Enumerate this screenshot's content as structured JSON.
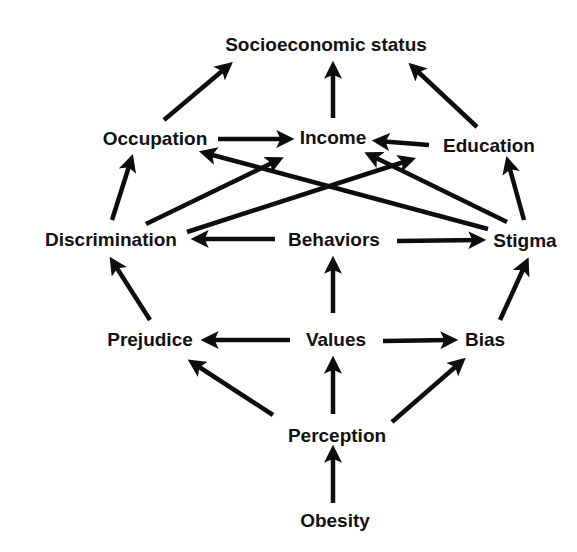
{
  "diagram": {
    "type": "directed-graph",
    "title": "",
    "colors": {
      "background": "#ffffff",
      "text": "#111111",
      "edge": "#0d0d0d"
    },
    "nodes": [
      {
        "id": "ses",
        "label": "Socioeconomic status",
        "x": 326,
        "y": 45
      },
      {
        "id": "occupation",
        "label": "Occupation",
        "x": 155,
        "y": 139
      },
      {
        "id": "income",
        "label": "Income",
        "x": 333,
        "y": 138
      },
      {
        "id": "education",
        "label": "Education",
        "x": 489,
        "y": 146
      },
      {
        "id": "discrimination",
        "label": "Discrimination",
        "x": 111,
        "y": 240
      },
      {
        "id": "behaviors",
        "label": "Behaviors",
        "x": 334,
        "y": 240
      },
      {
        "id": "stigma",
        "label": "Stigma",
        "x": 525,
        "y": 241
      },
      {
        "id": "prejudice",
        "label": "Prejudice",
        "x": 150,
        "y": 340
      },
      {
        "id": "values",
        "label": "Values",
        "x": 336,
        "y": 340
      },
      {
        "id": "bias",
        "label": "Bias",
        "x": 485,
        "y": 340
      },
      {
        "id": "perception",
        "label": "Perception",
        "x": 337,
        "y": 436
      },
      {
        "id": "obesity",
        "label": "Obesity",
        "x": 335,
        "y": 521
      }
    ],
    "edges": [
      {
        "from": "occupation",
        "to": "ses",
        "x1": 164,
        "y1": 120,
        "x2": 228,
        "y2": 66
      },
      {
        "from": "income",
        "to": "ses",
        "x1": 333,
        "y1": 118,
        "x2": 333,
        "y2": 67
      },
      {
        "from": "education",
        "to": "ses",
        "x1": 477,
        "y1": 127,
        "x2": 413,
        "y2": 67
      },
      {
        "from": "occupation",
        "to": "income",
        "x1": 218,
        "y1": 139,
        "x2": 288,
        "y2": 139
      },
      {
        "from": "education",
        "to": "income",
        "x1": 429,
        "y1": 145,
        "x2": 378,
        "y2": 141
      },
      {
        "from": "discrimination",
        "to": "occupation",
        "x1": 112,
        "y1": 220,
        "x2": 131,
        "y2": 160
      },
      {
        "from": "discrimination",
        "to": "income",
        "x1": 146,
        "y1": 224,
        "x2": 278,
        "y2": 160
      },
      {
        "from": "discrimination",
        "to": "education",
        "x1": 187,
        "y1": 232,
        "x2": 410,
        "y2": 160
      },
      {
        "from": "stigma",
        "to": "occupation",
        "x1": 488,
        "y1": 229,
        "x2": 205,
        "y2": 153
      },
      {
        "from": "stigma",
        "to": "income",
        "x1": 507,
        "y1": 222,
        "x2": 370,
        "y2": 155
      },
      {
        "from": "stigma",
        "to": "education",
        "x1": 524,
        "y1": 220,
        "x2": 508,
        "y2": 162
      },
      {
        "from": "behaviors",
        "to": "discrimination",
        "x1": 275,
        "y1": 239,
        "x2": 197,
        "y2": 239
      },
      {
        "from": "behaviors",
        "to": "stigma",
        "x1": 397,
        "y1": 241,
        "x2": 480,
        "y2": 240
      },
      {
        "from": "values",
        "to": "behaviors",
        "x1": 333,
        "y1": 313,
        "x2": 333,
        "y2": 262
      },
      {
        "from": "prejudice",
        "to": "discrimination",
        "x1": 150,
        "y1": 320,
        "x2": 113,
        "y2": 262
      },
      {
        "from": "bias",
        "to": "stigma",
        "x1": 500,
        "y1": 320,
        "x2": 526,
        "y2": 263
      },
      {
        "from": "values",
        "to": "prejudice",
        "x1": 290,
        "y1": 340,
        "x2": 207,
        "y2": 340
      },
      {
        "from": "values",
        "to": "bias",
        "x1": 383,
        "y1": 341,
        "x2": 452,
        "y2": 340
      },
      {
        "from": "perception",
        "to": "prejudice",
        "x1": 273,
        "y1": 415,
        "x2": 193,
        "y2": 363
      },
      {
        "from": "perception",
        "to": "values",
        "x1": 333,
        "y1": 414,
        "x2": 333,
        "y2": 362
      },
      {
        "from": "perception",
        "to": "bias",
        "x1": 392,
        "y1": 422,
        "x2": 461,
        "y2": 362
      },
      {
        "from": "obesity",
        "to": "perception",
        "x1": 333,
        "y1": 503,
        "x2": 333,
        "y2": 451
      }
    ]
  }
}
